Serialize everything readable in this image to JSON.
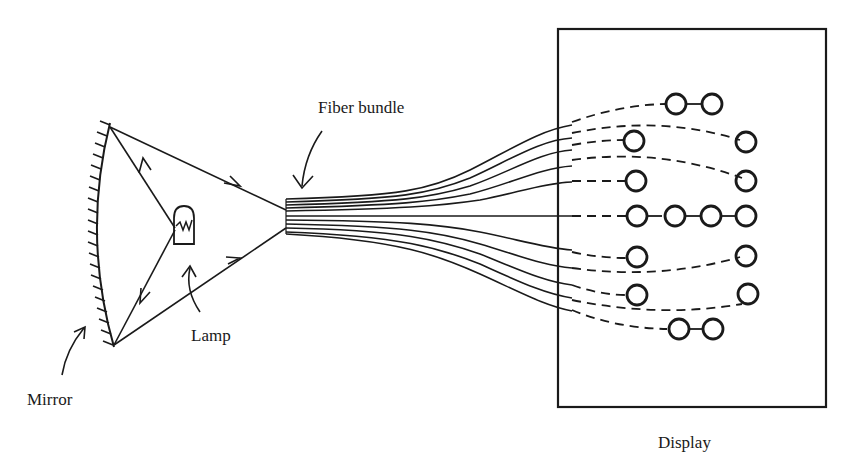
{
  "labels": {
    "fiber_bundle": "Fiber bundle",
    "lamp": "Lamp",
    "mirror": "Mirror",
    "display": "Display"
  },
  "colors": {
    "ink": "#1a1a1a",
    "background": "#ffffff"
  }
}
